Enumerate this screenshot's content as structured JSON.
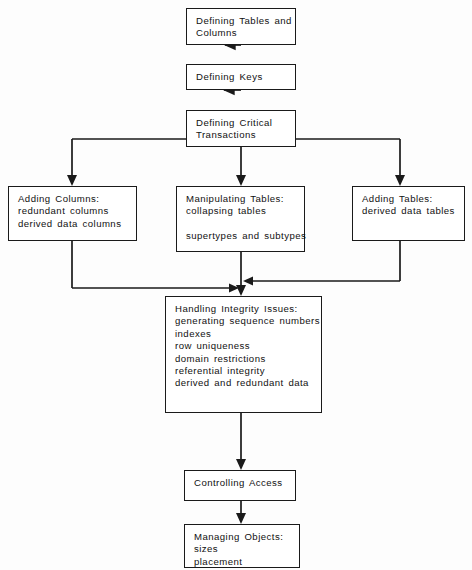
{
  "diagram": {
    "stroke_color": "#1a1a1a",
    "background_color": "#fdfdfd",
    "nodes": [
      {
        "id": "defining-tables",
        "lines": [
          "Defining Tables and",
          "Columns"
        ]
      },
      {
        "id": "defining-keys",
        "lines": [
          "Defining Keys"
        ]
      },
      {
        "id": "defining-critical",
        "lines": [
          "Defining Critical",
          "Transactions"
        ]
      },
      {
        "id": "adding-columns",
        "lines": [
          "Adding Columns:",
          "redundant columns",
          "derived data columns"
        ]
      },
      {
        "id": "manipulating-tables",
        "lines": [
          "Manipulating Tables:",
          "collapsing tables",
          "",
          "supertypes and subtypes"
        ]
      },
      {
        "id": "adding-tables",
        "lines": [
          "Adding Tables:",
          "derived data tables"
        ]
      },
      {
        "id": "handling-integrity",
        "lines": [
          "Handling Integrity Issues:",
          "generating sequence numbers",
          "indexes",
          "row uniqueness",
          "domain restrictions",
          "referential integrity",
          "derived and redundant data"
        ]
      },
      {
        "id": "controlling-access",
        "lines": [
          "Controlling Access"
        ]
      },
      {
        "id": "managing-objects",
        "lines": [
          "Managing Objects:",
          "sizes",
          "placement"
        ]
      }
    ]
  }
}
